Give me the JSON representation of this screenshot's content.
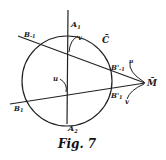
{
  "figure": {
    "caption": "Fig. 7",
    "colors": {
      "ink": "#222222",
      "background": "#ffffff"
    },
    "labels": {
      "A1": "A",
      "A1_sub": "1",
      "A2": "A",
      "A2_sub": "2",
      "C": "C̄",
      "M": "M̄",
      "B_minus1": "B",
      "B_minus1_sub": "-1",
      "B1": "B",
      "B1_sub": "1",
      "Bp_minus1": "B'",
      "Bp_minus1_sub": "-1",
      "Bp1": "B'",
      "Bp1_sub": "1",
      "u_center": "u",
      "v_top": "v",
      "u_right": "u",
      "v_right": "v"
    }
  }
}
